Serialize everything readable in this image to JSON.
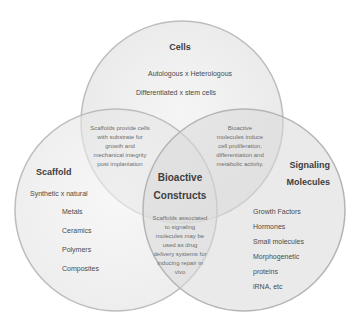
{
  "diagram": {
    "type": "venn",
    "circles": [
      {
        "id": "cells",
        "title": "Cells",
        "items": [
          "Autologous x Heterologous",
          "Differentiated x stem cells"
        ]
      },
      {
        "id": "scaffold",
        "title": "Scaffold",
        "items": [
          "Synthetic x natural",
          "Metals",
          "Ceramics",
          "Polymers",
          "Composites"
        ]
      },
      {
        "id": "signaling",
        "title_lines": [
          "Signaling",
          "Molecules"
        ],
        "items": [
          "Growth Factors",
          "Hormones",
          "Small molecules",
          "Morphogenetic",
          "proteins",
          "iRNA, etc"
        ]
      }
    ],
    "overlaps": {
      "cells_scaffold": [
        "Scaffolds provide cells",
        "with substrate for",
        "growth and",
        "mechanical integrity",
        "post implantation"
      ],
      "cells_signaling": [
        "Bioactive",
        "molecules induce",
        "cell proliferation,",
        "differentiation and",
        "metabolic activity."
      ],
      "scaffold_signaling": [
        "Scaffolds associated",
        "to signaling",
        "molecules may be",
        "used as drug",
        "delivery systems for",
        "inducing repair in",
        "vivo"
      ],
      "center": [
        "Bioactive",
        "Constructs"
      ]
    },
    "colors": {
      "circle_fill": "#e9e9e9",
      "circle_stroke": "#bdbdbd",
      "title_text": "#3d3d3d",
      "item_text": "#4a4a4a",
      "overlap_text": "#6e6e6e"
    }
  }
}
